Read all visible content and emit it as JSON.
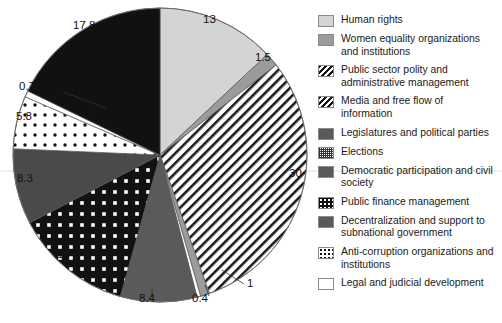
{
  "chart_data": {
    "type": "pie",
    "title": "",
    "labels_shown": true,
    "legend_position": "right",
    "categories": [
      "Human rights",
      "Women equality organizations and institutions",
      "Public sector polity and administrative management",
      "Media and free flow of information",
      "Legislatures and political parties",
      "Elections",
      "Democratic participation and civil society",
      "Public finance management",
      "Decentralization and support to subnational government",
      "Anti-corruption organizations and institutions",
      "Legal and judicial development"
    ],
    "values": [
      13,
      1.5,
      30,
      1,
      0.4,
      8.4,
      13,
      8.3,
      5.8,
      0.7,
      17.8
    ],
    "value_labels": [
      "13",
      "1.5",
      "30",
      "1",
      "0.4",
      "8.4",
      "13",
      "8.3",
      "5.8",
      "0.7",
      "17.8"
    ]
  },
  "pie": {
    "slices": [
      {
        "label": "13",
        "value": 13,
        "pattern": "lightgray",
        "category": "Human rights"
      },
      {
        "label": "1.5",
        "value": 1.5,
        "pattern": "midgray",
        "category": "Women equality organizations and institutions"
      },
      {
        "label": "30",
        "value": 30,
        "pattern": "hatch",
        "category": "Public sector polity and administrative management"
      },
      {
        "label": "1",
        "value": 1,
        "pattern": "midgray",
        "category": "Media and free flow of information"
      },
      {
        "label": "0.4",
        "value": 0.4,
        "pattern": "white",
        "category": "Legislatures and political parties"
      },
      {
        "label": "8.4",
        "value": 8.4,
        "pattern": "darkgray",
        "category": "Elections"
      },
      {
        "label": "13",
        "value": 13,
        "pattern": "blackdots",
        "category": "Democratic participation and civil society"
      },
      {
        "label": "8.3",
        "value": 8.3,
        "pattern": "darkgray2",
        "category": "Public finance management"
      },
      {
        "label": "5.8",
        "value": 5.8,
        "pattern": "whitedots",
        "category": "Decentralization and support to subnational government"
      },
      {
        "label": "0.7",
        "value": 0.7,
        "pattern": "white",
        "category": "Anti-corruption organizations and institutions"
      },
      {
        "label": "17.8",
        "value": 17.8,
        "pattern": "black",
        "category": "Legal and judicial development"
      }
    ],
    "labels": {
      "l13_top": "13",
      "l15": "1.5",
      "l30": "30",
      "l1": "1",
      "l04": "0.4",
      "l84": "8.4",
      "l13_left": "13",
      "l83": "8.3",
      "l58": "5.8",
      "l07": "0.7",
      "l178": "17.8"
    }
  },
  "legend": {
    "items": [
      {
        "label": "Human rights",
        "swatch": "lightgray"
      },
      {
        "label": "Women equality organizations and institutions",
        "swatch": "midgray"
      },
      {
        "label": "Public sector polity and administrative management",
        "swatch": "hatch"
      },
      {
        "label": "Media and free flow of information",
        "swatch": "hatch"
      },
      {
        "label": "Legislatures and political parties",
        "swatch": "darkgray"
      },
      {
        "label": "Elections",
        "swatch": "check"
      },
      {
        "label": "Democratic participation and civil society",
        "swatch": "darkgray"
      },
      {
        "label": "Public finance management",
        "swatch": "blackdots"
      },
      {
        "label": "Decentralization and support to subnational government",
        "swatch": "darkgray"
      },
      {
        "label": "Anti-corruption organizations and institutions",
        "swatch": "whitedots"
      },
      {
        "label": "Legal and judicial development",
        "swatch": "white"
      }
    ]
  },
  "colors": {
    "light_gray": "#d4d4d4",
    "mid_gray": "#9b9b9b",
    "dark_gray": "#5a5a5a",
    "black": "#111111",
    "white": "#ffffff",
    "outline": "#6f6f6f"
  }
}
